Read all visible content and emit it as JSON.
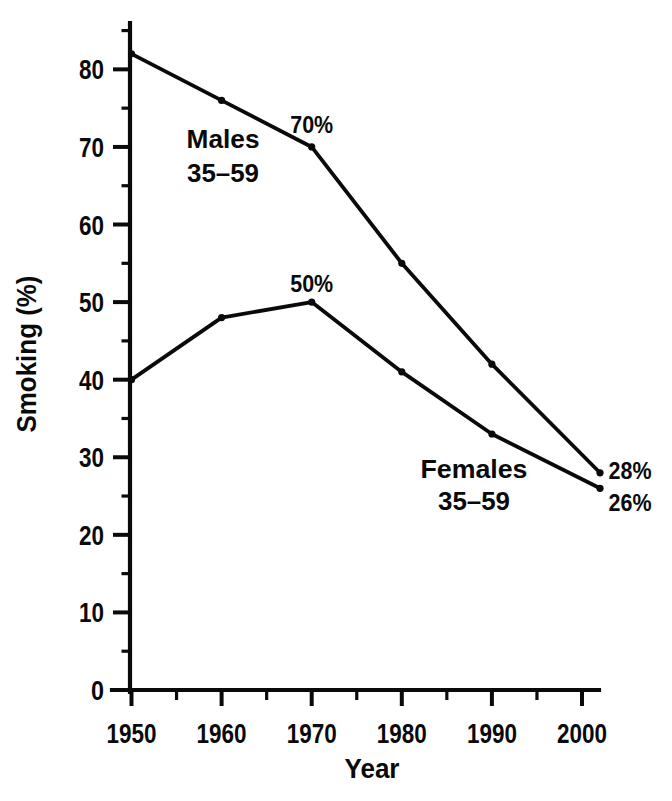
{
  "chart_data": {
    "type": "line",
    "title": "",
    "xlabel": "Year",
    "ylabel": "Smoking (%)",
    "x": [
      1950,
      1960,
      1970,
      1980,
      1990,
      2002
    ],
    "series": [
      {
        "name": "Males 35–59",
        "label_lines": [
          "Males",
          "35–59"
        ],
        "values": [
          82,
          76,
          70,
          55,
          42,
          28
        ]
      },
      {
        "name": "Females 35–59",
        "label_lines": [
          "Females",
          "35–59"
        ],
        "values": [
          40,
          48,
          50,
          41,
          33,
          26
        ]
      }
    ],
    "point_labels": [
      {
        "id": "males-1970",
        "series": 0,
        "x": 1970,
        "text": "70%"
      },
      {
        "id": "females-1970",
        "series": 1,
        "x": 1970,
        "text": "50%"
      },
      {
        "id": "males-2002",
        "series": 0,
        "x": 2002,
        "text": "28%"
      },
      {
        "id": "females-2002",
        "series": 1,
        "x": 2002,
        "text": "26%"
      }
    ],
    "xlim": [
      1950,
      2002
    ],
    "ylim": [
      0,
      85
    ],
    "x_major_ticks": [
      1950,
      1960,
      1970,
      1980,
      1990,
      2000
    ],
    "x_minor_ticks": [
      1955,
      1965,
      1975,
      1985,
      1995
    ],
    "y_major_ticks": [
      0,
      10,
      20,
      30,
      40,
      50,
      60,
      70,
      80
    ],
    "y_minor_ticks": [
      5,
      15,
      25,
      35,
      45,
      55,
      65,
      75,
      85
    ],
    "grid": false,
    "legend": "inline-labels",
    "line_color": "#0a0a0a",
    "background": "#ffffff"
  }
}
